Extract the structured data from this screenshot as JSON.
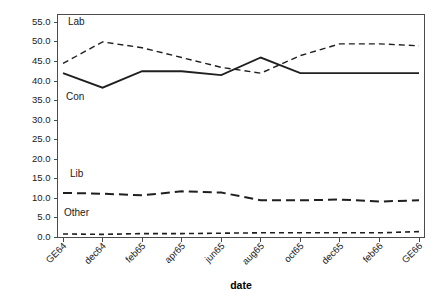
{
  "chart_data": {
    "type": "line",
    "title": "",
    "xlabel": "date",
    "ylabel": "",
    "grid": false,
    "legend_position": "inline-labels",
    "categories": [
      "GE64",
      "dec64",
      "feb65",
      "apr65",
      "jun65",
      "aug65",
      "oct65",
      "dec65",
      "feb66",
      "GE66"
    ],
    "ylim": [
      0,
      57
    ],
    "ytick_labels": [
      "0.0",
      "5.0",
      "10.0",
      "15.0",
      "20.0",
      "25.0",
      "30.0",
      "35.0",
      "40.0",
      "45.0",
      "50.0",
      "55.0"
    ],
    "ytick_values": [
      0,
      5,
      10,
      15,
      20,
      25,
      30,
      35,
      40,
      45,
      50,
      55
    ],
    "series": [
      {
        "name": "Lab",
        "label": "Lab",
        "dash": "6,4",
        "width": 1.4,
        "color": "#1f1f1f",
        "values": [
          44.5,
          50.0,
          48.5,
          46.0,
          43.5,
          42.0,
          46.5,
          49.5,
          49.5,
          49.0
        ]
      },
      {
        "name": "Con",
        "label": "Con",
        "dash": "none",
        "width": 1.8,
        "color": "#1f1f1f",
        "values": [
          42.0,
          38.3,
          42.5,
          42.5,
          41.5,
          46.0,
          42.0,
          42.0,
          42.0,
          42.0
        ]
      },
      {
        "name": "Lib",
        "label": "Lib",
        "dash": "9,5",
        "width": 2.0,
        "color": "#1f1f1f",
        "values": [
          11.4,
          11.2,
          10.8,
          11.8,
          11.5,
          9.5,
          9.5,
          9.7,
          9.2,
          9.5
        ]
      },
      {
        "name": "Other",
        "label": "Other",
        "dash": "5,4",
        "width": 1.6,
        "color": "#1f1f1f",
        "values": [
          0.9,
          0.8,
          1.0,
          1.0,
          1.1,
          1.2,
          1.2,
          1.2,
          1.2,
          1.5
        ]
      }
    ],
    "series_label_positions": [
      {
        "name": "Lab",
        "x": 68,
        "y": 25
      },
      {
        "name": "Con",
        "x": 66,
        "y": 100
      },
      {
        "name": "Lib",
        "x": 70,
        "y": 177
      },
      {
        "name": "Other",
        "x": 64,
        "y": 216
      }
    ]
  }
}
